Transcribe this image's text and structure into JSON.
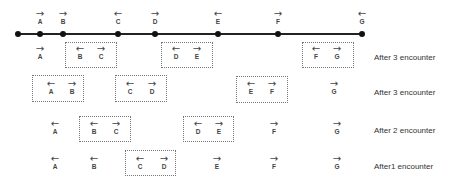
{
  "diagram": {
    "top_line": {
      "nodes": [
        {
          "name": "A",
          "direction": "right"
        },
        {
          "name": "B",
          "direction": "right"
        },
        {
          "name": "C",
          "direction": "left"
        },
        {
          "name": "D",
          "direction": "right"
        },
        {
          "name": "E",
          "direction": "left"
        },
        {
          "name": "F",
          "direction": "right"
        },
        {
          "name": "G",
          "direction": "left"
        }
      ]
    },
    "rows": [
      {
        "label": "After 3 encounter",
        "nodes": [
          {
            "name": "A",
            "direction": "right"
          },
          {
            "name": "B",
            "direction": "left"
          },
          {
            "name": "C",
            "direction": "right"
          },
          {
            "name": "D",
            "direction": "left"
          },
          {
            "name": "E",
            "direction": "right"
          },
          {
            "name": "F",
            "direction": "left"
          },
          {
            "name": "G",
            "direction": "right"
          }
        ],
        "groups": [
          [
            "B",
            "C"
          ],
          [
            "D",
            "E"
          ],
          [
            "F",
            "G"
          ]
        ]
      },
      {
        "label": "After 3 encounter",
        "nodes": [
          {
            "name": "A",
            "direction": "left"
          },
          {
            "name": "B",
            "direction": "right"
          },
          {
            "name": "C",
            "direction": "left"
          },
          {
            "name": "D",
            "direction": "right"
          },
          {
            "name": "E",
            "direction": "left"
          },
          {
            "name": "F",
            "direction": "right"
          },
          {
            "name": "G",
            "direction": "right"
          }
        ],
        "groups": [
          [
            "A",
            "B"
          ],
          [
            "C",
            "D"
          ],
          [
            "E",
            "F"
          ]
        ]
      },
      {
        "label": "After 2 encounter",
        "nodes": [
          {
            "name": "A",
            "direction": "left"
          },
          {
            "name": "B",
            "direction": "left"
          },
          {
            "name": "C",
            "direction": "right"
          },
          {
            "name": "D",
            "direction": "left"
          },
          {
            "name": "E",
            "direction": "right"
          },
          {
            "name": "F",
            "direction": "right"
          },
          {
            "name": "G",
            "direction": "right"
          }
        ],
        "groups": [
          [
            "B",
            "C"
          ],
          [
            "D",
            "E"
          ]
        ]
      },
      {
        "label": "After1 encounter",
        "nodes": [
          {
            "name": "A",
            "direction": "left"
          },
          {
            "name": "B",
            "direction": "left"
          },
          {
            "name": "C",
            "direction": "left"
          },
          {
            "name": "D",
            "direction": "right"
          },
          {
            "name": "E",
            "direction": "right"
          },
          {
            "name": "F",
            "direction": "right"
          },
          {
            "name": "G",
            "direction": "right"
          }
        ],
        "groups": [
          [
            "C",
            "D"
          ]
        ]
      }
    ],
    "arrow_glyphs": {
      "left": "←",
      "right": "→"
    }
  }
}
